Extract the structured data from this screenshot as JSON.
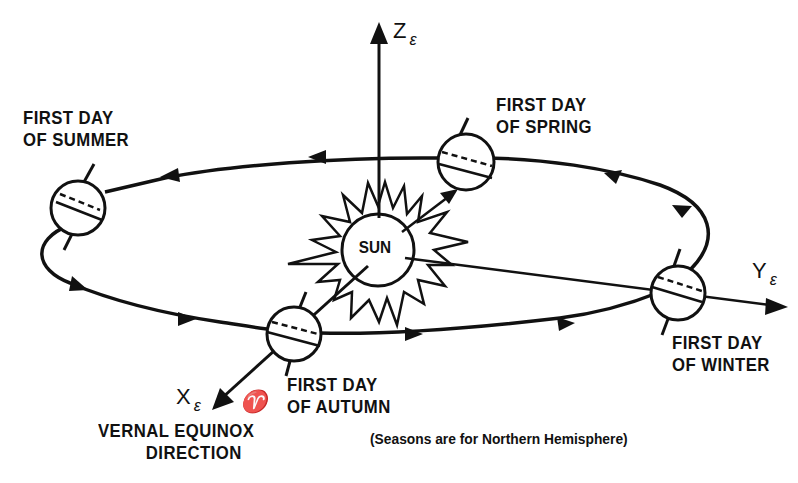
{
  "diagram": {
    "type": "orbital-geometry",
    "colors": {
      "ink": "#111111",
      "background": "#ffffff"
    },
    "center": {
      "label": "SUN"
    },
    "axes": {
      "z": {
        "label": "Z",
        "subscript": "ε"
      },
      "y": {
        "label": "Y",
        "subscript": "ε"
      },
      "x": {
        "label": "X",
        "subscript": "ε",
        "symbol": "♈"
      }
    },
    "seasons": {
      "summer": {
        "line1": "FIRST DAY",
        "line2": "OF SUMMER"
      },
      "spring": {
        "line1": "FIRST DAY",
        "line2": "OF SPRING"
      },
      "winter": {
        "line1": "FIRST DAY",
        "line2": "OF WINTER"
      },
      "autumn": {
        "line1": "FIRST DAY",
        "line2": "OF AUTUMN"
      }
    },
    "vernal_equinox": {
      "line1": "VERNAL EQUINOX",
      "line2": "DIRECTION"
    },
    "note": "(Seasons are for Northern Hemisphere)",
    "orbit_direction": "counterclockwise (viewed from above)"
  }
}
